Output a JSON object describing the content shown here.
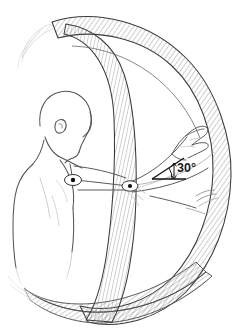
{
  "figure": {
    "background_color": "#ffffff",
    "ink_color": "#3a3a3a",
    "hatch_color": "#8d8d8d",
    "body_line_color": "#555555",
    "faint_color": "#c8c8c8",
    "top_artifact_text": "· · ·"
  },
  "annotations": {
    "angle": {
      "label": "30°",
      "value": 30,
      "unit": "degrees",
      "name": "elevation-angle"
    }
  },
  "markers": [
    {
      "name": "shoulder-joint-marker",
      "label": ""
    },
    {
      "name": "elbow-joint-marker",
      "label": ""
    }
  ],
  "parts": {
    "shell_outer": "hemisphere-outer-band",
    "shell_meridian": "hemisphere-meridian-band",
    "shell_equator": "hemisphere-equator-band",
    "body": "human-figure",
    "arm": "right-arm",
    "hand": "right-hand"
  }
}
